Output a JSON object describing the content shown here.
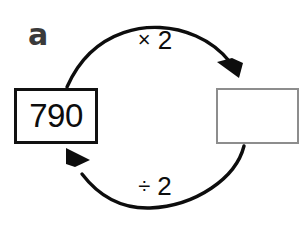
{
  "diagram": {
    "part_label": "a",
    "type": "function-machine-cycle",
    "nodes": [
      {
        "id": "start-value",
        "value": "790",
        "filled": true,
        "border_color": "#111111"
      },
      {
        "id": "result-value",
        "value": "",
        "filled": false,
        "border_color": "#8d8d8d"
      }
    ],
    "edges": [
      {
        "id": "forward",
        "operator": "×",
        "operand": "2",
        "label": "× 2",
        "direction": "left-to-right",
        "arrow": "arrowhead-down-right"
      },
      {
        "id": "inverse",
        "operator": "÷",
        "operand": "2",
        "label": "÷ 2",
        "direction": "right-to-left",
        "arrow": "arrowhead-up-left"
      }
    ],
    "colors": {
      "ink": "#0d0d0d",
      "label_gray": "#3a3a3a",
      "box_gray": "#8d8d8d",
      "background": "#ffffff"
    }
  }
}
